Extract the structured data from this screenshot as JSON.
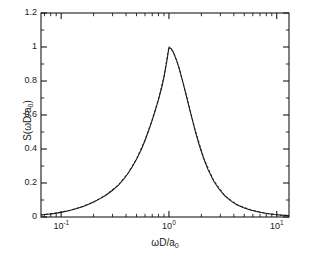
{
  "chart_data": {
    "type": "line",
    "title": "",
    "xlabel": "ωD/a₀",
    "ylabel": "S(ωD/a₀)",
    "xscale": "log",
    "yscale": "linear",
    "xlim": [
      0.065,
      13.0
    ],
    "ylim": [
      0,
      1.2
    ],
    "grid": false,
    "legend": "none",
    "xticks": [
      {
        "value": 0.1,
        "label_mantissa": "10",
        "label_exponent": "-1"
      },
      {
        "value": 1.0,
        "label_mantissa": "10",
        "label_exponent": "0"
      },
      {
        "value": 10.0,
        "label_mantissa": "10",
        "label_exponent": "1"
      }
    ],
    "yticks": [
      {
        "value": 0,
        "label": "0"
      },
      {
        "value": 0.2,
        "label": "0.2"
      },
      {
        "value": 0.4,
        "label": "0.4"
      },
      {
        "value": 0.6,
        "label": "0.6"
      },
      {
        "value": 0.8,
        "label": "0.8"
      },
      {
        "value": 1.0,
        "label": "1"
      },
      {
        "value": 1.2,
        "label": "1.2"
      }
    ],
    "peak": {
      "x": 1.0,
      "y": 1.0
    },
    "series": [
      {
        "name": "solid-curve",
        "style": "solid",
        "color": "#1a1a1a",
        "x": [
          0.065,
          0.075,
          0.085,
          0.1,
          0.12,
          0.14,
          0.16,
          0.18,
          0.2,
          0.23,
          0.26,
          0.3,
          0.34,
          0.38,
          0.42,
          0.46,
          0.5,
          0.55,
          0.6,
          0.65,
          0.7,
          0.75,
          0.8,
          0.85,
          0.9,
          0.95,
          1.0,
          1.05,
          1.1,
          1.18,
          1.25,
          1.35,
          1.45,
          1.6,
          1.75,
          1.9,
          2.1,
          2.3,
          2.6,
          2.9,
          3.3,
          3.8,
          4.3,
          5.0,
          5.8,
          6.8,
          8.0,
          9.5,
          11.0,
          13.0
        ],
        "y": [
          0.012,
          0.016,
          0.02,
          0.027,
          0.038,
          0.05,
          0.062,
          0.075,
          0.088,
          0.108,
          0.128,
          0.157,
          0.188,
          0.222,
          0.259,
          0.298,
          0.339,
          0.393,
          0.45,
          0.51,
          0.57,
          0.63,
          0.69,
          0.752,
          0.823,
          0.906,
          0.996,
          0.99,
          0.968,
          0.92,
          0.868,
          0.79,
          0.712,
          0.603,
          0.508,
          0.428,
          0.344,
          0.28,
          0.212,
          0.166,
          0.124,
          0.092,
          0.071,
          0.053,
          0.04,
          0.029,
          0.021,
          0.015,
          0.011,
          0.008
        ]
      },
      {
        "name": "dashed-curve",
        "style": "dashed",
        "color": "#1a1a1a",
        "x": [
          0.065,
          0.085,
          0.12,
          0.16,
          0.2,
          0.26,
          0.34,
          0.42,
          0.5,
          0.6,
          0.7,
          0.8,
          0.9,
          1.0,
          1.1,
          1.25,
          1.45,
          1.75,
          2.1,
          2.6,
          3.3,
          4.3,
          5.8,
          8.0,
          11.0,
          13.0
        ],
        "y": [
          0.013,
          0.021,
          0.039,
          0.063,
          0.089,
          0.13,
          0.19,
          0.262,
          0.342,
          0.454,
          0.575,
          0.695,
          0.83,
          1.004,
          0.972,
          0.874,
          0.716,
          0.512,
          0.347,
          0.215,
          0.126,
          0.072,
          0.041,
          0.022,
          0.011,
          0.008
        ]
      }
    ],
    "axes_frame": {
      "left": 41,
      "top": 13,
      "right": 289,
      "bottom": 217,
      "line_color": "#1a1a1a"
    }
  }
}
